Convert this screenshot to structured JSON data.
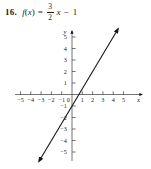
{
  "problem": {
    "number": "16.",
    "fname": "f",
    "lparen": "(",
    "var": "x",
    "rparen": ")",
    "equals": "=",
    "numerator": "3",
    "denominator": "2",
    "var2": "x",
    "tail": "− 1"
  },
  "graph": {
    "x_axis_label": "x",
    "y_axis_label": "y",
    "axis_color": "#3a3a3a",
    "line_color": "#151515",
    "text_color": "#222222"
  },
  "chart_data": {
    "type": "line",
    "xlabel": "x",
    "ylabel": "y",
    "xlim": [
      -5.8,
      5.9
    ],
    "ylim": [
      -6,
      6
    ],
    "grid": false,
    "legend": "none",
    "x_ticks": [
      -5,
      -4,
      -3,
      -2,
      -1,
      0,
      1,
      2,
      3,
      4,
      5
    ],
    "y_ticks": [
      -5,
      -4,
      -3,
      -2,
      -1,
      1,
      2,
      3,
      4,
      5
    ],
    "series": [
      {
        "name": "f(x) = (3/2)x − 1",
        "slope": 1.5,
        "intercept": -1,
        "x_intercept": 0.667,
        "sample_points": [
          {
            "x": -3.2,
            "y": -5.8
          },
          {
            "x": -2,
            "y": -4
          },
          {
            "x": 0,
            "y": -1
          },
          {
            "x": 0.667,
            "y": 0
          },
          {
            "x": 2,
            "y": 2
          },
          {
            "x": 4,
            "y": 5
          },
          {
            "x": 4.47,
            "y": 5.7
          }
        ],
        "arrows": "both-ends"
      }
    ]
  }
}
